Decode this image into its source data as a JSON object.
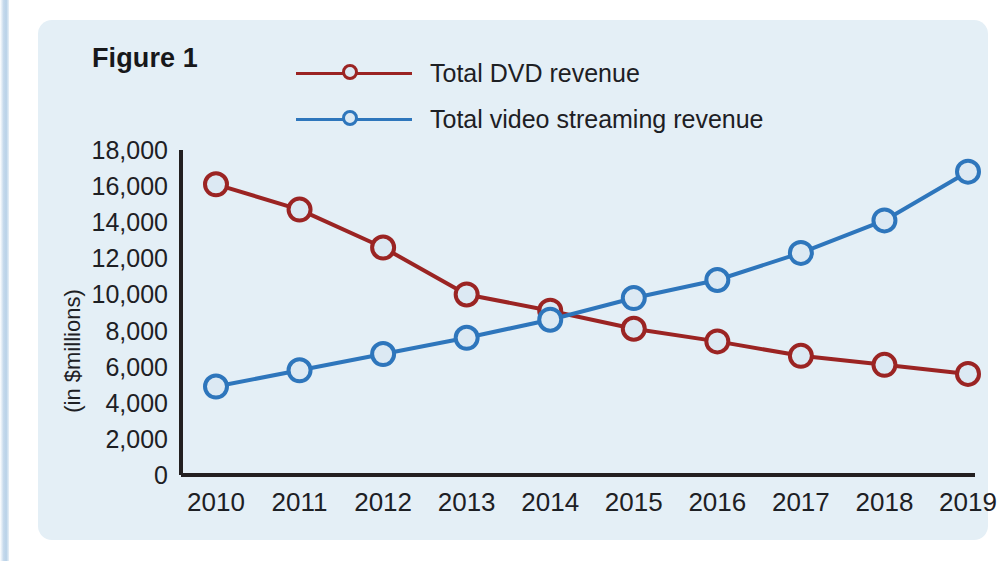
{
  "figure": {
    "title": "Figure 1"
  },
  "legend": [
    {
      "label": "Total DVD revenue",
      "color": "#9B2423",
      "marker": "circle-marker-icon"
    },
    {
      "label": "Total video streaming revenue",
      "color": "#2E76BC",
      "marker": "circle-marker-icon"
    }
  ],
  "axes": {
    "y_title": "(in $millions)",
    "y_ticks": [
      "18,000",
      "16,000",
      "14,000",
      "12,000",
      "10,000",
      "8,000",
      "6,000",
      "4,000",
      "2,000",
      "0"
    ],
    "x_ticks": [
      "2010",
      "2011",
      "2012",
      "2013",
      "2014",
      "2015",
      "2016",
      "2017",
      "2018",
      "2019"
    ]
  },
  "colors": {
    "dvd": "#9B2423",
    "streaming": "#2E76BC",
    "panel": "#e4eff6",
    "axis": "#231f20",
    "marker_fill": "#dce9f3"
  },
  "chart_data": {
    "type": "line",
    "title": "Figure 1",
    "xlabel": "",
    "ylabel": "(in $millions)",
    "x": [
      2010,
      2011,
      2012,
      2013,
      2014,
      2015,
      2016,
      2017,
      2018,
      2019
    ],
    "categories": [
      "2010",
      "2011",
      "2012",
      "2013",
      "2014",
      "2015",
      "2016",
      "2017",
      "2018",
      "2019"
    ],
    "ylim": [
      0,
      18000
    ],
    "ytick_values": [
      0,
      2000,
      4000,
      6000,
      8000,
      10000,
      12000,
      14000,
      16000,
      18000
    ],
    "grid": false,
    "legend_position": "top",
    "series": [
      {
        "name": "Total DVD revenue",
        "color": "#9B2423",
        "values": [
          16100,
          14700,
          12600,
          10000,
          9100,
          8100,
          7400,
          6600,
          6100,
          5600
        ]
      },
      {
        "name": "Total video streaming revenue",
        "color": "#2E76BC",
        "values": [
          4900,
          5800,
          6700,
          7600,
          8600,
          9800,
          10800,
          12300,
          14100,
          16800
        ]
      }
    ]
  }
}
